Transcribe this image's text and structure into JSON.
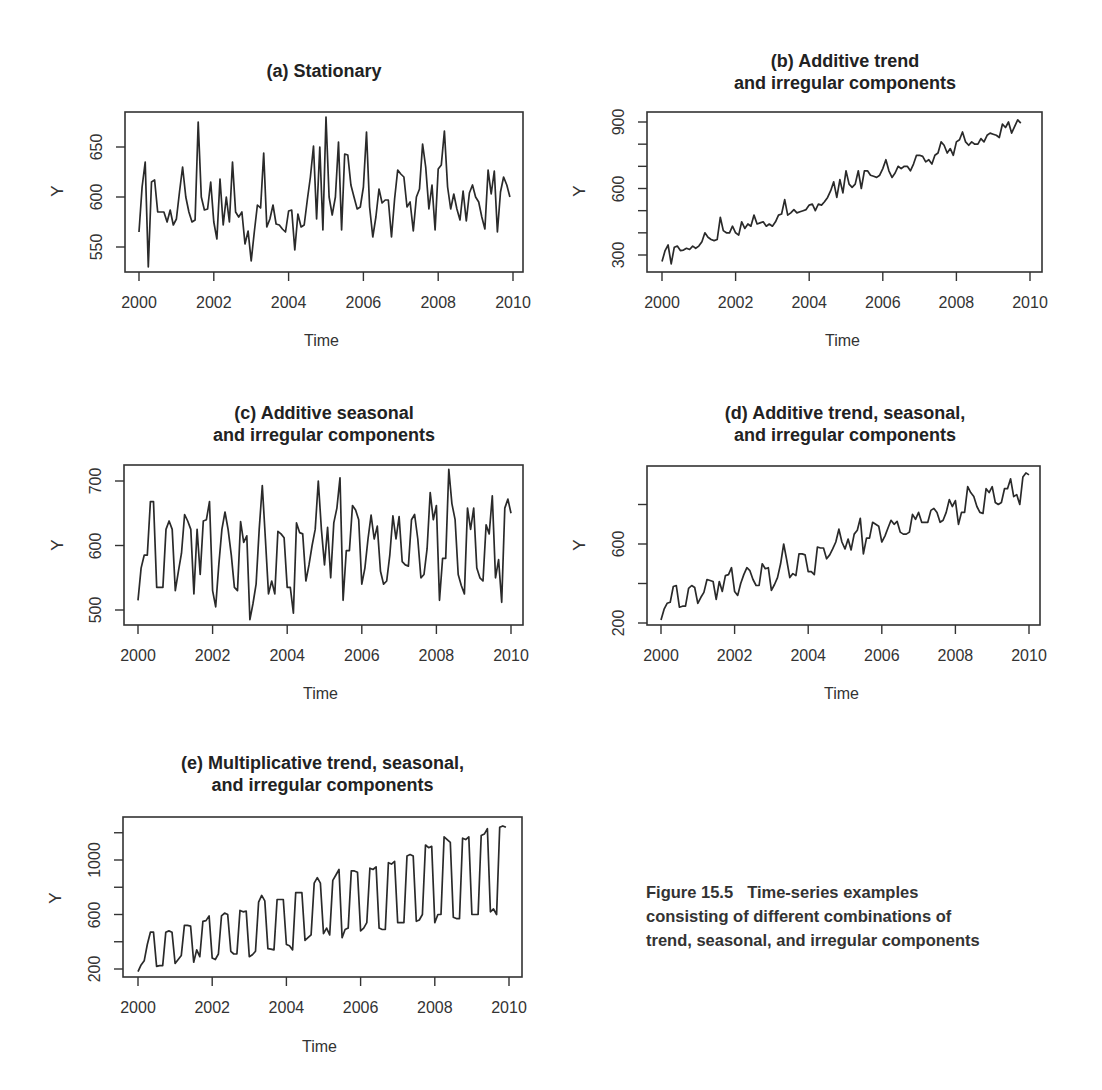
{
  "figure": {
    "caption_label": "Figure 15.5",
    "caption_line1": "Time-series examples",
    "caption_line2": "consisting of different combinations of",
    "caption_line3": "trend, seasonal, and irregular components"
  },
  "chart_data": [
    {
      "id": "a",
      "type": "line",
      "title": "(a) Stationary",
      "xlabel": "Time",
      "ylabel": "Y",
      "x_ticks": [
        "2000",
        "2002",
        "2004",
        "2006",
        "2008",
        "2010"
      ],
      "y_ticks": [
        "550",
        "600",
        "650"
      ],
      "xlim": [
        2000,
        2010
      ],
      "ylim": [
        527,
        683
      ],
      "frequency": "monthly",
      "start": 2000,
      "values": [
        565,
        610,
        635,
        530,
        615,
        617,
        585,
        585,
        585,
        575,
        587,
        572,
        578,
        605,
        630,
        600,
        585,
        575,
        577,
        675,
        600,
        587,
        588,
        615,
        575,
        558,
        618,
        572,
        600,
        575,
        635,
        585,
        580,
        585,
        553,
        566,
        536,
        565,
        592,
        589,
        644,
        570,
        578,
        592,
        573,
        572,
        568,
        565,
        586,
        587,
        547,
        583,
        570,
        572,
        597,
        620,
        651,
        578,
        650,
        567,
        680,
        600,
        582,
        600,
        655,
        567,
        643,
        642,
        612,
        600,
        588,
        590,
        610,
        665,
        590,
        560,
        580,
        608,
        594,
        597,
        597,
        560,
        598,
        627,
        623,
        620,
        590,
        595,
        566,
        600,
        608,
        653,
        630,
        588,
        612,
        567,
        628,
        632,
        666,
        610,
        588,
        603,
        588,
        577,
        606,
        576,
        604,
        612,
        600,
        595,
        580,
        568,
        627,
        603,
        626,
        565,
        605,
        620,
        612,
        600
      ]
    },
    {
      "id": "b",
      "type": "line",
      "title": "(b) Additive trend\nand irregular components",
      "xlabel": "Time",
      "ylabel": "Y",
      "x_ticks": [
        "2000",
        "2002",
        "2004",
        "2006",
        "2008",
        "2010"
      ],
      "y_ticks": [
        "300",
        "600",
        "900"
      ],
      "y_minor_ticks": [
        300,
        400,
        500,
        600,
        700,
        800,
        900
      ],
      "xlim": [
        2000,
        2010
      ],
      "ylim": [
        255,
        945
      ],
      "frequency": "monthly",
      "start": 2000,
      "values": [
        270,
        320,
        345,
        260,
        335,
        340,
        320,
        322,
        330,
        325,
        340,
        330,
        340,
        360,
        400,
        380,
        370,
        365,
        370,
        470,
        410,
        400,
        400,
        430,
        400,
        390,
        450,
        420,
        440,
        430,
        480,
        440,
        445,
        450,
        430,
        440,
        430,
        450,
        480,
        485,
        550,
        480,
        490,
        505,
        490,
        495,
        500,
        505,
        525,
        530,
        500,
        530,
        525,
        540,
        560,
        590,
        630,
        560,
        640,
        580,
        680,
        620,
        605,
        620,
        680,
        600,
        680,
        680,
        660,
        655,
        650,
        660,
        690,
        730,
        680,
        650,
        670,
        700,
        690,
        700,
        700,
        680,
        710,
        750,
        750,
        745,
        720,
        730,
        710,
        750,
        760,
        810,
        795,
        760,
        780,
        750,
        810,
        820,
        855,
        810,
        795,
        810,
        800,
        800,
        825,
        810,
        840,
        850,
        845,
        840,
        830,
        890,
        875,
        900,
        850,
        880,
        910,
        895
      ]
    },
    {
      "id": "c",
      "type": "line",
      "title": "(c) Additive seasonal\nand irregular components",
      "xlabel": "Time",
      "ylabel": "Y",
      "x_ticks": [
        "2000",
        "2002",
        "2004",
        "2006",
        "2008",
        "2010"
      ],
      "y_ticks": [
        "500",
        "600",
        "700"
      ],
      "xlim": [
        2000,
        2010
      ],
      "ylim": [
        475,
        722
      ],
      "frequency": "monthly",
      "start": 2000,
      "values": [
        515,
        565,
        585,
        585,
        668,
        668,
        535,
        535,
        535,
        625,
        638,
        625,
        530,
        560,
        588,
        648,
        638,
        625,
        525,
        625,
        555,
        638,
        640,
        668,
        530,
        505,
        570,
        625,
        652,
        625,
        585,
        535,
        530,
        637,
        605,
        615,
        485,
        510,
        540,
        625,
        693,
        610,
        525,
        545,
        525,
        622,
        618,
        612,
        535,
        535,
        495,
        635,
        620,
        618,
        545,
        570,
        600,
        625,
        700,
        625,
        570,
        628,
        550,
        635,
        658,
        705,
        515,
        592,
        592,
        662,
        655,
        640,
        540,
        565,
        610,
        647,
        610,
        630,
        560,
        540,
        545,
        585,
        646,
        610,
        645,
        575,
        570,
        568,
        640,
        648,
        610,
        550,
        555,
        595,
        682,
        640,
        662,
        515,
        580,
        580,
        718,
        665,
        640,
        555,
        538,
        525,
        658,
        625,
        658,
        565,
        550,
        545,
        632,
        618,
        677,
        550,
        578,
        512,
        658,
        672,
        650
      ]
    },
    {
      "id": "d",
      "type": "line",
      "title": "(d) Additive trend, seasonal,\nand irregular components",
      "xlabel": "Time",
      "ylabel": "Y",
      "x_ticks": [
        "2000",
        "2002",
        "2004",
        "2006",
        "2008",
        "2010"
      ],
      "y_ticks": [
        "200",
        "600"
      ],
      "y_minor_ticks": [
        200,
        400,
        600,
        800
      ],
      "xlim": [
        2000,
        2010
      ],
      "ylim": [
        195,
        1020
      ],
      "frequency": "monthly",
      "start": 2000,
      "values": [
        215,
        270,
        300,
        305,
        385,
        390,
        280,
        285,
        285,
        375,
        390,
        380,
        300,
        330,
        355,
        420,
        415,
        410,
        320,
        410,
        360,
        440,
        445,
        480,
        360,
        340,
        400,
        445,
        480,
        465,
        420,
        390,
        390,
        500,
        475,
        480,
        365,
        395,
        430,
        500,
        600,
        520,
        430,
        450,
        440,
        550,
        550,
        545,
        460,
        460,
        445,
        585,
        580,
        580,
        525,
        545,
        575,
        610,
        675,
        610,
        575,
        625,
        570,
        650,
        670,
        730,
        550,
        630,
        630,
        710,
        700,
        690,
        610,
        640,
        680,
        720,
        700,
        715,
        660,
        650,
        650,
        660,
        750,
        725,
        760,
        710,
        710,
        710,
        770,
        780,
        760,
        710,
        720,
        760,
        825,
        790,
        820,
        700,
        760,
        760,
        890,
        860,
        840,
        790,
        760,
        755,
        880,
        860,
        890,
        810,
        800,
        810,
        880,
        880,
        930,
        840,
        850,
        800,
        940,
        960,
        950
      ]
    },
    {
      "id": "e",
      "type": "line",
      "title": "(e) Multiplicative trend, seasonal,\nand irregular components",
      "xlabel": "Time",
      "ylabel": "Y",
      "x_ticks": [
        "2000",
        "2002",
        "2004",
        "2006",
        "2008",
        "2010"
      ],
      "y_ticks": [
        "200",
        "600",
        "1000"
      ],
      "y_minor_ticks": [
        200,
        400,
        600,
        800,
        1000,
        1200
      ],
      "xlim": [
        2000,
        2010
      ],
      "ylim": [
        140,
        1280
      ],
      "frequency": "monthly",
      "start": 2000,
      "values": [
        180,
        230,
        260,
        380,
        470,
        470,
        220,
        225,
        225,
        470,
        480,
        470,
        240,
        270,
        300,
        520,
        520,
        515,
        250,
        340,
        290,
        550,
        555,
        590,
        280,
        270,
        310,
        590,
        610,
        600,
        330,
        310,
        310,
        630,
        620,
        625,
        290,
        305,
        330,
        690,
        740,
        700,
        350,
        345,
        340,
        710,
        710,
        710,
        380,
        370,
        340,
        760,
        760,
        760,
        410,
        430,
        450,
        830,
        870,
        830,
        460,
        500,
        450,
        850,
        890,
        930,
        430,
        490,
        500,
        920,
        920,
        910,
        480,
        500,
        540,
        940,
        930,
        950,
        500,
        490,
        490,
        980,
        970,
        990,
        540,
        540,
        540,
        1030,
        1040,
        1030,
        550,
        560,
        600,
        1110,
        1090,
        1100,
        540,
        600,
        600,
        1170,
        1150,
        1130,
        580,
        570,
        570,
        1160,
        1150,
        1170,
        600,
        600,
        600,
        1180,
        1190,
        1230,
        620,
        640,
        600,
        1240,
        1250,
        1240
      ]
    }
  ]
}
